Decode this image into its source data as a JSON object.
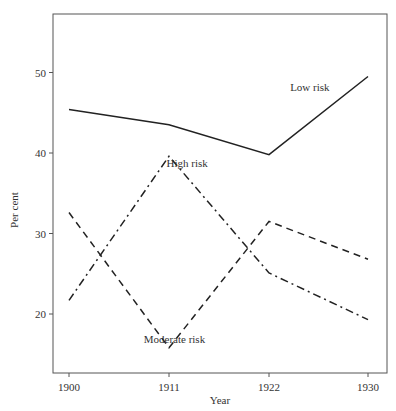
{
  "chart_data": {
    "type": "line",
    "title": "",
    "xlabel": "Year",
    "ylabel": "Per cent",
    "x": [
      1900,
      1911,
      1922,
      1930
    ],
    "x_tick_labels": [
      "1900",
      "1911",
      "1922",
      "1930"
    ],
    "y_ticks": [
      20,
      30,
      40,
      50
    ],
    "y_tick_labels": [
      "20",
      "30",
      "40",
      "50"
    ],
    "ylim": [
      12.8,
      56.3
    ],
    "grid": false,
    "legend": "inline labels",
    "series": [
      {
        "name": "Low risk",
        "style": "solid",
        "values": [
          45.4,
          43.5,
          39.8,
          49.5
        ]
      },
      {
        "name": "High risk",
        "style": "dash-dot",
        "values": [
          21.7,
          39.6,
          25.1,
          19.3
        ]
      },
      {
        "name": "Moderate risk",
        "style": "dashed",
        "values": [
          32.6,
          15.8,
          31.5,
          26.8
        ]
      }
    ],
    "annotations": [
      {
        "text": "Low risk",
        "x": 1925.3,
        "y": 47.7
      },
      {
        "text": "High risk",
        "x": 1913.0,
        "y": 38.2
      },
      {
        "text": "Moderate risk",
        "x": 1911.6,
        "y": 16.4
      }
    ]
  }
}
